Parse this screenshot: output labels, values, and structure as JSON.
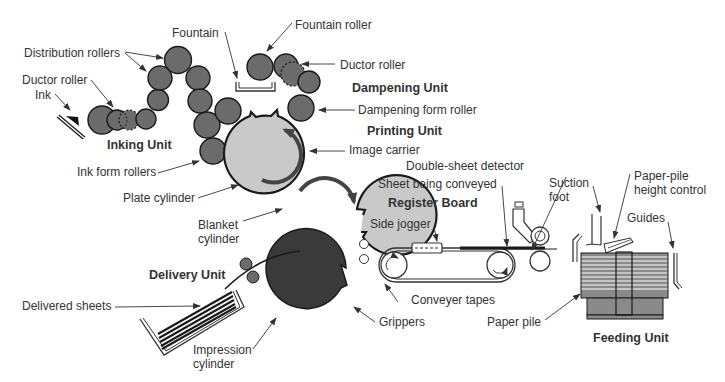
{
  "colors": {
    "roller": "#6b6b6b",
    "cylinder_light": "#c9c9c9",
    "impression_cylinder": "#3a3a3a",
    "outline": "#1a1a1a",
    "text": "#333333",
    "paper_pile": "#8a8a8a"
  },
  "units": {
    "inking": "Inking Unit",
    "dampening": "Dampening Unit",
    "printing": "Printing Unit",
    "register": "Register Board",
    "delivery": "Delivery Unit",
    "feeding": "Feeding Unit"
  },
  "labels": {
    "fountain": "Fountain",
    "fountain_roller": "Fountain roller",
    "distribution_rollers": "Distribution rollers",
    "ductor_roller_ink": "Ductor roller",
    "ink": "Ink",
    "ductor_roller_damp": "Ductor roller",
    "dampening_form_roller": "Dampening form roller",
    "image_carrier": "Image carrier",
    "ink_form_rollers": "Ink form rollers",
    "plate_cylinder": "Plate cylinder",
    "blanket_cylinder_1": "Blanket",
    "blanket_cylinder_2": "cylinder",
    "double_sheet_detector": "Double-sheet detector",
    "sheet_being_conveyed": "Sheet being conveyed",
    "side_jogger": "Side jogger",
    "conveyer_tapes": "Conveyer tapes",
    "grippers": "Grippers",
    "delivered_sheets": "Delivered sheets",
    "impression_cylinder_1": "Impression",
    "impression_cylinder_2": "cylinder",
    "paper_pile": "Paper pile",
    "suction_foot_1": "Suction",
    "suction_foot_2": "foot",
    "paper_pile_height_control_1": "Paper-pile",
    "paper_pile_height_control_2": "height control",
    "guides": "Guides"
  }
}
